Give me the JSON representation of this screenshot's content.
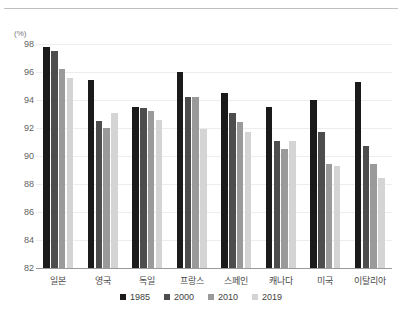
{
  "chart_data": {
    "type": "bar",
    "title": "",
    "subtitle": "",
    "xlabel": "",
    "ylabel": "",
    "unit_label": "(%)",
    "ylim": [
      82,
      98
    ],
    "yticks": [
      82,
      84,
      86,
      88,
      90,
      92,
      94,
      96,
      98
    ],
    "grid": true,
    "legend_position": "bottom-center",
    "categories": [
      "일본",
      "영국",
      "독일",
      "프랑스",
      "스페인",
      "캐나다",
      "미국",
      "이탈리아"
    ],
    "series": [
      {
        "name": "1985",
        "color": "#1a1a1a",
        "values": [
          97.8,
          95.4,
          93.5,
          96.0,
          94.5,
          93.5,
          94.0,
          95.3
        ]
      },
      {
        "name": "2000",
        "color": "#4d4d4d",
        "values": [
          97.5,
          92.5,
          93.4,
          94.2,
          93.1,
          91.1,
          91.7,
          90.7
        ]
      },
      {
        "name": "2010",
        "color": "#9a9a9a",
        "values": [
          96.2,
          92.0,
          93.2,
          94.2,
          92.4,
          90.5,
          89.4,
          89.4
        ]
      },
      {
        "name": "2019",
        "color": "#d4d4d4",
        "values": [
          95.6,
          93.1,
          92.6,
          91.9,
          91.7,
          91.1,
          89.3,
          88.4
        ]
      }
    ]
  },
  "colors": {
    "gridline": "#ededed",
    "axis": "#9a9a9a",
    "tick_text": "#636363",
    "category_text": "#4a4a4a",
    "legend_text": "#3d3d3d",
    "top_rule": "#bfbfbf",
    "background": "#ffffff"
  }
}
